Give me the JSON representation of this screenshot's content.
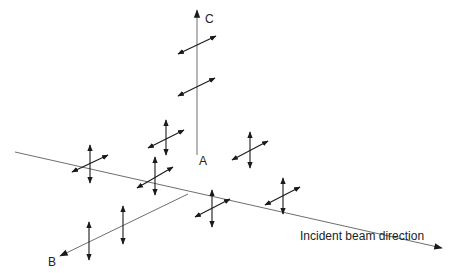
{
  "diagram": {
    "labels": {
      "axis_c": "C",
      "axis_b": "B",
      "origin_a": "A",
      "beam": "Incident beam direction"
    },
    "colors": {
      "line": "#6e6e6e",
      "arrow": "#1a1a1a",
      "text": "#222222"
    },
    "axes": [
      {
        "name": "incident-beam-axis",
        "from": [
          15,
          152
        ],
        "to": [
          442,
          248
        ],
        "arrowhead": "end"
      },
      {
        "name": "c-axis",
        "from": [
          197,
          155
        ],
        "to": [
          197,
          10
        ],
        "arrowhead": "end"
      },
      {
        "name": "b-axis",
        "from": [
          188,
          194
        ],
        "to": [
          60,
          256
        ],
        "arrowhead": "end"
      }
    ],
    "polarization_markers": [
      {
        "name": "c-upper",
        "vertical": null,
        "diagonal": [
          [
            178,
            54
          ],
          [
            216,
            36
          ]
        ]
      },
      {
        "name": "c-lower",
        "vertical": null,
        "diagonal": [
          [
            178,
            96
          ],
          [
            215,
            78
          ]
        ]
      },
      {
        "name": "beam-cross-1",
        "vertical": [
          [
            90,
            145
          ],
          [
            90,
            183
          ]
        ],
        "diagonal": [
          [
            72,
            172
          ],
          [
            108,
            155
          ]
        ]
      },
      {
        "name": "upper-cross",
        "vertical": [
          [
            166,
            120
          ],
          [
            166,
            155
          ]
        ],
        "diagonal": [
          [
            148,
            148
          ],
          [
            184,
            130
          ]
        ]
      },
      {
        "name": "beam-cross-2",
        "vertical": [
          [
            155,
            157
          ],
          [
            155,
            195
          ]
        ],
        "diagonal": [
          [
            137,
            188
          ],
          [
            173,
            167
          ]
        ]
      },
      {
        "name": "right-cross",
        "vertical": [
          [
            250,
            132
          ],
          [
            250,
            168
          ]
        ],
        "diagonal": [
          [
            232,
            160
          ],
          [
            268,
            141
          ]
        ]
      },
      {
        "name": "lower-cross",
        "vertical": [
          [
            212,
            190
          ],
          [
            212,
            227
          ]
        ],
        "diagonal": [
          [
            195,
            217
          ],
          [
            230,
            199
          ]
        ]
      },
      {
        "name": "beam-cross-3",
        "vertical": [
          [
            283,
            178
          ],
          [
            283,
            214
          ]
        ],
        "diagonal": [
          [
            265,
            205
          ],
          [
            300,
            187
          ]
        ]
      },
      {
        "name": "b-vertical-1",
        "vertical": [
          [
            89,
            222
          ],
          [
            89,
            260
          ]
        ],
        "diagonal": null
      },
      {
        "name": "b-vertical-2",
        "vertical": [
          [
            123,
            206
          ],
          [
            123,
            244
          ]
        ],
        "diagonal": null
      }
    ]
  }
}
